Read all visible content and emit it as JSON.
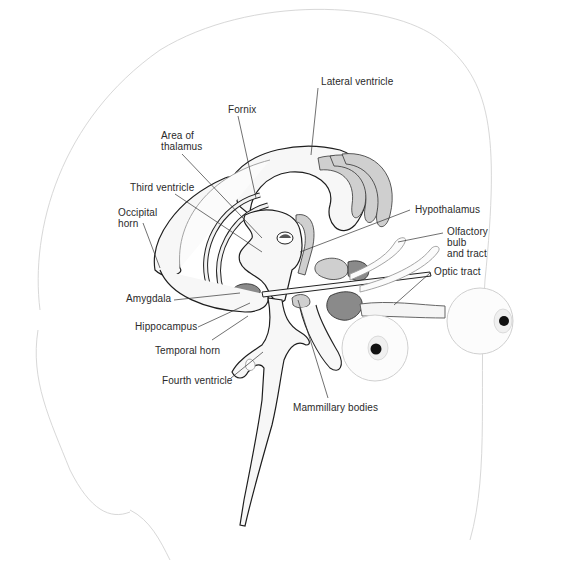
{
  "figure": {
    "labels": [
      {
        "id": "lateral-ventricle",
        "text": "Lateral ventricle",
        "x": 321,
        "y": 76,
        "anchor": [
          311,
          155
        ],
        "from": [
          318,
          88
        ]
      },
      {
        "id": "fornix",
        "text": "Fornix",
        "x": 228,
        "y": 104,
        "anchor": [
          256,
          198
        ],
        "from": [
          238,
          116
        ]
      },
      {
        "id": "area-of-thalamus",
        "text": "Area of\nthalamus",
        "x": 161,
        "y": 130,
        "anchor": [
          262,
          238
        ],
        "from": [
          182,
          154
        ]
      },
      {
        "id": "third-ventricle",
        "text": "Third ventricle",
        "x": 130,
        "y": 182,
        "anchor": [
          262,
          252
        ],
        "from": [
          175,
          194
        ]
      },
      {
        "id": "occipital-horn",
        "text": "Occipital\nhorn",
        "x": 118,
        "y": 207,
        "anchor": [
          160,
          268
        ],
        "from": [
          143,
          223
        ]
      },
      {
        "id": "hypothalamus",
        "text": "Hypothalamus",
        "x": 415,
        "y": 204,
        "anchor": [
          300,
          252
        ],
        "from": [
          410,
          210
        ]
      },
      {
        "id": "olfactory-bulb",
        "text": "Olfactory\nbulb\nand tract",
        "x": 447,
        "y": 226,
        "anchor": [
          398,
          242
        ],
        "from": [
          443,
          233
        ]
      },
      {
        "id": "optic-tract",
        "text": "Optic tract",
        "x": 434,
        "y": 266,
        "anchor": [
          394,
          305
        ],
        "from": [
          430,
          273
        ]
      },
      {
        "id": "amygdala",
        "text": "Amygdala",
        "x": 126,
        "y": 293,
        "anchor": [
          240,
          293
        ],
        "from": [
          174,
          300
        ]
      },
      {
        "id": "hippocampus",
        "text": "Hippocampus",
        "x": 135,
        "y": 321,
        "anchor": [
          250,
          303
        ],
        "from": [
          198,
          327
        ]
      },
      {
        "id": "temporal-horn",
        "text": "Temporal horn",
        "x": 155,
        "y": 345,
        "anchor": [
          248,
          316
        ],
        "from": [
          212,
          340
        ]
      },
      {
        "id": "fourth-ventricle",
        "text": "Fourth ventricle",
        "x": 162,
        "y": 375,
        "anchor": [
          263,
          352
        ],
        "from": [
          231,
          378
        ]
      },
      {
        "id": "mammillary-bodies",
        "text": "Mammillary bodies",
        "x": 293,
        "y": 402,
        "anchor": [
          298,
          300
        ],
        "from": [
          328,
          398
        ]
      }
    ]
  }
}
